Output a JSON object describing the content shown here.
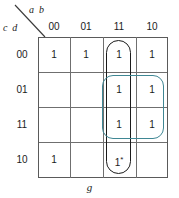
{
  "kmap": {
    "function_label": "g",
    "row_variables": "c d",
    "col_variables": "a b",
    "col_headers": [
      "00",
      "01",
      "11",
      "10"
    ],
    "row_headers": [
      "00",
      "01",
      "11",
      "10"
    ],
    "cells": [
      [
        {
          "value": "1",
          "marker": ""
        },
        {
          "value": "1",
          "marker": ""
        },
        {
          "value": "1",
          "marker": ""
        },
        {
          "value": "1",
          "marker": ""
        }
      ],
      [
        {
          "value": "",
          "marker": ""
        },
        {
          "value": "",
          "marker": ""
        },
        {
          "value": "1",
          "marker": ""
        },
        {
          "value": "1",
          "marker": ""
        }
      ],
      [
        {
          "value": "",
          "marker": ""
        },
        {
          "value": "",
          "marker": ""
        },
        {
          "value": "1",
          "marker": ""
        },
        {
          "value": "1",
          "marker": ""
        }
      ],
      [
        {
          "value": "1",
          "marker": ""
        },
        {
          "value": "",
          "marker": ""
        },
        {
          "value": "1",
          "marker": "*"
        },
        {
          "value": "",
          "marker": ""
        }
      ]
    ],
    "groups": [
      {
        "name": "group-column-11",
        "style": "vertical",
        "color": "#1b1b1b",
        "col_start": 2,
        "col_end": 2,
        "row_start": 0,
        "row_end": 3
      },
      {
        "name": "group-block-rows-01-11-cols-11-10",
        "style": "block",
        "color": "#3f8794",
        "col_start": 2,
        "col_end": 3,
        "row_start": 1,
        "row_end": 2
      }
    ],
    "colors": {
      "grid": "#6f6f6f",
      "text": "#1b1b1b",
      "group_black": "#1b1b1b",
      "group_teal": "#3f8794",
      "background": "#ffffff"
    }
  }
}
